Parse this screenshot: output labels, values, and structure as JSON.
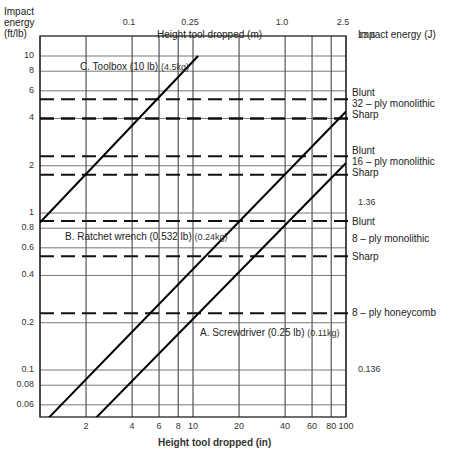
{
  "chart_data": {
    "type": "line",
    "title": "",
    "xlabel": "Height tool dropped (in)",
    "xlabel_top": "Height tool dropped (m)",
    "ylabel": "Impact energy (ft/lb)",
    "ylabel_right": "Impact energy (J)",
    "x_scale": "log",
    "y_scale": "log",
    "xlim": [
      1,
      100
    ],
    "ylim": [
      0.047,
      10
    ],
    "grid": true,
    "x_ticks": [
      2,
      4,
      6,
      8,
      10,
      20,
      40,
      60,
      80,
      100
    ],
    "x_tick_labels": [
      "2",
      "4",
      "6",
      "8",
      "10",
      "20",
      "40",
      "60",
      "80",
      "100"
    ],
    "x_grid": [
      1,
      2,
      4,
      6,
      8,
      10,
      20,
      40,
      60,
      80,
      100
    ],
    "x_top_ticks": [
      {
        "label": "0.1",
        "in": 3.94
      },
      {
        "label": "0.25",
        "in": 9.84
      },
      {
        "label": "1.0",
        "in": 39.4
      },
      {
        "label": "2.5",
        "in": 98.4
      }
    ],
    "y_ticks": [
      0.06,
      0.08,
      0.1,
      0.2,
      0.4,
      0.6,
      0.8,
      1,
      2,
      4,
      6,
      8,
      10
    ],
    "y_tick_labels": [
      "0.06",
      "0.08",
      "0.1",
      "0.2",
      "0.4",
      "0.6",
      "0.8",
      "1",
      "2",
      "4",
      "6",
      "8",
      "10"
    ],
    "y_right_ticks": [
      {
        "label": "13.6",
        "ft_lb": 10
      },
      {
        "label": "1.36",
        "ft_lb": 1
      },
      {
        "label": "0.136",
        "ft_lb": 0.1
      }
    ],
    "series": [
      {
        "name": "A. Screwdriver (0.25 lb) (0.11kg)",
        "label_main": "A.  Screwdriver (0.25 lb)",
        "label_kg": "(0.11kg)",
        "x": [
          2.2,
          100
        ],
        "y": [
          0.047,
          2.08
        ],
        "style": "solid"
      },
      {
        "name": "B. Ratchet wrench (0.532 lb) (0.24kg)",
        "label_main": "B.  Ratchet wrench (0.532 lb)",
        "label_kg": "(0.24kg)",
        "x": [
          1.08,
          100
        ],
        "y": [
          0.047,
          4.43
        ],
        "style": "solid"
      },
      {
        "name": "C. Toolbox (10 lb) (4.5kg)",
        "label_main": "C.   Toolbox (10 lb)",
        "label_kg": "(4.5kg)",
        "x": [
          1,
          10.8
        ],
        "y": [
          0.87,
          10
        ],
        "style": "solid"
      }
    ],
    "thresholds": [
      {
        "material": "32 - ply monolithic",
        "type": "Blunt",
        "y": 5.3
      },
      {
        "material": "32 - ply monolithic",
        "type": "Sharp",
        "y": 4.0
      },
      {
        "material": "16 - ply monolithic",
        "type": "Blunt",
        "y": 2.3
      },
      {
        "material": "16 - ply monolithic",
        "type": "Sharp",
        "y": 1.75
      },
      {
        "material": "8 - ply monolithic",
        "type": "Blunt",
        "y": 0.89
      },
      {
        "material": "8 - ply monolithic",
        "type": "Sharp",
        "y": 0.53
      },
      {
        "material": "8 - ply honeycomb",
        "type": "",
        "y": 0.23
      }
    ]
  },
  "labels": {
    "y_left_title_1": "Impact",
    "y_left_title_2": "energy",
    "y_left_title_3": "(ft/lb)",
    "y_right_title": "Impact energy  (J)",
    "x_top_title": "Height tool dropped  (m)",
    "x_bottom_title": "Height tool dropped (in)",
    "blunt": "Blunt",
    "sharp": "Sharp",
    "ply32": "32 – ply monolithic",
    "ply16": "16 – ply monolithic",
    "ply8": "8 – ply monolithic",
    "ply8h": "8 – ply honeycomb"
  }
}
